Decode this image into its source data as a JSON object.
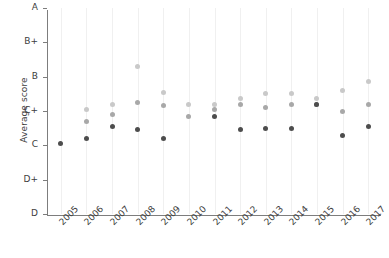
{
  "chart_data": {
    "type": "scatter",
    "title": "",
    "xlabel": "",
    "ylabel": "Average score",
    "grid": "vertical-only",
    "legend": "none",
    "categories": [
      "2005",
      "2006",
      "2007",
      "2008",
      "2009",
      "2010",
      "2011",
      "2012",
      "2013",
      "2014",
      "2015",
      "2016",
      "2017"
    ],
    "ytick_labels": [
      "A",
      "B+",
      "B",
      "C+",
      "C",
      "D+",
      "D"
    ],
    "ytick_values": [
      6,
      5,
      4,
      3,
      2,
      1,
      0
    ],
    "ylim": [
      0,
      6
    ],
    "series": [
      {
        "name": "series-light",
        "color": "#c9c9c9",
        "values": [
          null,
          3.05,
          3.2,
          4.3,
          3.55,
          3.2,
          3.2,
          3.35,
          3.5,
          3.5,
          3.35,
          3.6,
          3.85
        ]
      },
      {
        "name": "series-medium",
        "color": "#a8a8a8",
        "values": [
          null,
          2.7,
          2.9,
          3.25,
          3.15,
          2.85,
          3.05,
          3.2,
          3.1,
          3.2,
          3.2,
          3.0,
          3.2
        ]
      },
      {
        "name": "series-dark",
        "color": "#4d4d4d",
        "values": [
          2.05,
          2.2,
          2.55,
          2.45,
          2.2,
          null,
          2.85,
          2.45,
          2.5,
          2.5,
          3.2,
          2.3,
          2.55
        ]
      }
    ]
  }
}
